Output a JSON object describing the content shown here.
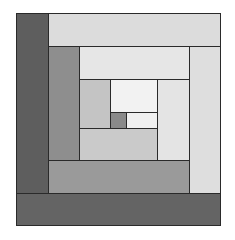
{
  "diagram": {
    "frame": {
      "x": 16,
      "y": 13,
      "w": 205,
      "h": 213
    },
    "patches": [
      {
        "name": "outer-left-dark-strip",
        "x": 16,
        "y": 13,
        "w": 33,
        "h": 181,
        "color": "#5e5e5e"
      },
      {
        "name": "outer-top-light-strip",
        "x": 48,
        "y": 13,
        "w": 173,
        "h": 34,
        "color": "#dcdcdc"
      },
      {
        "name": "outer-right-light-strip",
        "x": 189,
        "y": 46,
        "w": 32,
        "h": 148,
        "color": "#dedede"
      },
      {
        "name": "outer-bottom-dark-strip",
        "x": 16,
        "y": 193,
        "w": 205,
        "h": 33,
        "color": "#646464"
      },
      {
        "name": "middle-left-gray-strip",
        "x": 48,
        "y": 46,
        "w": 32,
        "h": 115,
        "color": "#8e8e8e"
      },
      {
        "name": "middle-top-light-strip",
        "x": 79,
        "y": 46,
        "w": 111,
        "h": 34,
        "color": "#e6e6e6"
      },
      {
        "name": "middle-right-light-strip",
        "x": 157,
        "y": 79,
        "w": 33,
        "h": 82,
        "color": "#e4e4e4"
      },
      {
        "name": "middle-bottom-gray-strip",
        "x": 48,
        "y": 160,
        "w": 142,
        "h": 34,
        "color": "#9a9a9a"
      },
      {
        "name": "inner-left-light-strip",
        "x": 79,
        "y": 79,
        "w": 32,
        "h": 50,
        "color": "#c4c4c4"
      },
      {
        "name": "inner-top-white-strip",
        "x": 110,
        "y": 79,
        "w": 48,
        "h": 34,
        "color": "#f2f2f2"
      },
      {
        "name": "inner-right-white-strip",
        "x": 126,
        "y": 112,
        "w": 32,
        "h": 17,
        "color": "#f0f0f0"
      },
      {
        "name": "inner-bottom-light-strip",
        "x": 79,
        "y": 128,
        "w": 79,
        "h": 33,
        "color": "#cacaca"
      },
      {
        "name": "center-square",
        "x": 110,
        "y": 112,
        "w": 17,
        "h": 17,
        "color": "#8a8a8a"
      }
    ]
  }
}
